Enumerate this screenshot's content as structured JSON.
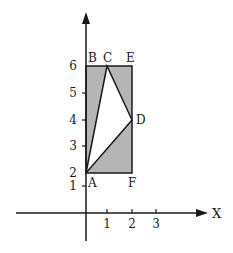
{
  "diagram": {
    "axes": {
      "x_label": "X",
      "x_ticks": [
        "1",
        "2",
        "3"
      ],
      "y_ticks": [
        "1",
        "2",
        "3",
        "4",
        "5",
        "6"
      ]
    },
    "points": {
      "A": {
        "label": "A",
        "x": 0,
        "y": 2
      },
      "B": {
        "label": "B",
        "x": 0,
        "y": 6
      },
      "C": {
        "label": "C",
        "x": 1,
        "y": 6
      },
      "D": {
        "label": "D",
        "x": 2,
        "y": 4
      },
      "E": {
        "label": "E",
        "x": 2,
        "y": 6
      },
      "F": {
        "label": "F",
        "x": 2,
        "y": 2
      }
    },
    "rectangle": "ABEF",
    "unshaded_triangle": "ACD",
    "colors": {
      "shade": "#b5b5b5",
      "line": "#1a1a1a",
      "background": "#ffffff"
    }
  }
}
